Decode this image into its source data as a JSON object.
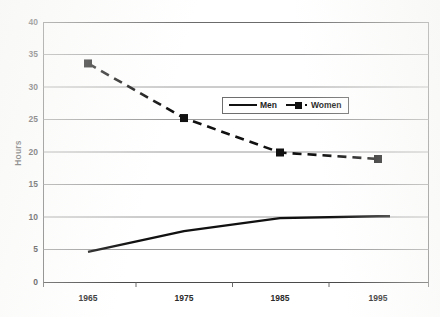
{
  "chart_data": {
    "type": "line",
    "title": "",
    "subtitle": "",
    "xlabel": "",
    "ylabel": "Hours",
    "x": [
      1965,
      1975,
      1985,
      1995
    ],
    "categories": [
      "1965",
      "1975",
      "1985",
      "1995"
    ],
    "series": [
      {
        "name": "Men",
        "values": [
          4.7,
          7.9,
          9.9,
          10.2
        ],
        "style": "solid",
        "marker": "none",
        "color": "#111111"
      },
      {
        "name": "Women",
        "values": [
          33.7,
          25.3,
          20.0,
          19.0
        ],
        "style": "dashed",
        "marker": "square",
        "color": "#111111"
      }
    ],
    "ylim": [
      0,
      40
    ],
    "ytick_values": [
      0,
      5,
      10,
      15,
      20,
      25,
      30,
      35,
      40
    ],
    "ytick_labels": [
      "0",
      "5",
      "10",
      "15",
      "20",
      "25",
      "30",
      "35",
      "40"
    ],
    "xtick_labels": [
      "1965",
      "1975",
      "1985",
      "1995"
    ],
    "grid": "horizontal",
    "legend_position": "inside-upper-center",
    "legend_entries": [
      "Men",
      "Women"
    ],
    "plot_border": true,
    "background_color": "#ffffff",
    "line_color": "#111111",
    "grid_color": "#8f8f8f",
    "axis_color": "#555555"
  },
  "axes": {
    "y_title": "Hours",
    "y_ticks": [
      "40",
      "35",
      "30",
      "25",
      "20",
      "15",
      "10",
      "5",
      "0"
    ],
    "x_ticks": [
      "1965",
      "1975",
      "1985",
      "1995"
    ]
  },
  "legend": {
    "men_label": "Men",
    "women_label": "Women"
  }
}
